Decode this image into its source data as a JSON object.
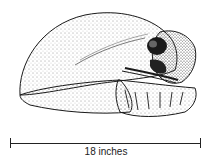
{
  "illustration": {
    "subject": "stippled skull illustration",
    "ink_color": "#1a1a1a",
    "background": "#ffffff"
  },
  "scale_bar": {
    "label": "18 inches"
  }
}
